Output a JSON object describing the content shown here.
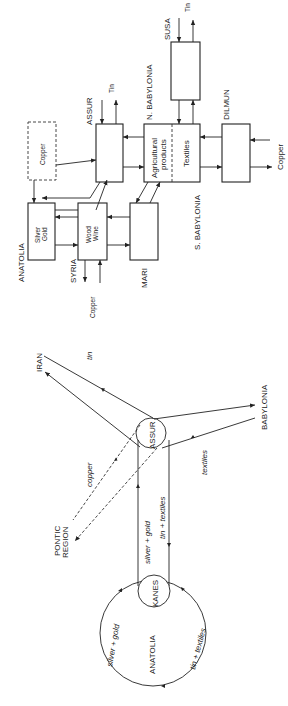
{
  "block_diagram": {
    "nodes": {
      "susa": {
        "label": "SUSA",
        "flow_label": "Tin"
      },
      "assur": {
        "label": "ASSUR",
        "flow_label": "Tin"
      },
      "n_babylonia": {
        "label": "N. BABYLONIA",
        "left_text": "Agricultural",
        "left_text2": "products",
        "right_text": "Textiles"
      },
      "s_babylonia": {
        "label": "S. BABYLONIA"
      },
      "dilmun": {
        "label": "DILMUN",
        "flow_label": "Copper"
      },
      "copper_source": {
        "label": "Copper"
      },
      "anatolia": {
        "label": "ANATOLIA",
        "text1": "Silver",
        "text2": "Gold"
      },
      "syria": {
        "label": "SYRIA",
        "text1": "Wood",
        "text2": "Wine",
        "flow_label": "Copper"
      },
      "mari": {
        "label": "MARI"
      }
    }
  },
  "network_diagram": {
    "nodes": {
      "iran": "IRAN",
      "assur": "ASSUR",
      "babylonia": "BABYLONIA",
      "pontic1": "PONTIC",
      "pontic2": "REGION",
      "kanes": "KANES",
      "anatolia": "ANATOLIA"
    },
    "flows": {
      "tin": "tin",
      "copper": "copper",
      "textiles": "textiles",
      "silver_gold": "silver + gold",
      "tin_textiles": "tin + textiles",
      "anatolia_silver_gold": "silver + gold",
      "anatolia_tin_textiles": "tin + textiles"
    }
  }
}
